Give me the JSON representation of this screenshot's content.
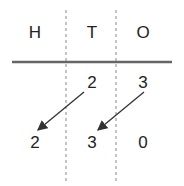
{
  "headers": [
    {
      "label": "H",
      "x": 35
    },
    {
      "label": "T",
      "x": 92
    },
    {
      "label": "O",
      "x": 143
    }
  ],
  "row1": [
    {
      "value": "2",
      "x": 92
    },
    {
      "value": "3",
      "x": 143
    }
  ],
  "row2": [
    {
      "value": "2",
      "x": 35
    },
    {
      "value": "3",
      "x": 92
    },
    {
      "value": "0",
      "x": 143
    }
  ],
  "colors": {
    "line": "#666666",
    "text": "#222222",
    "arrow": "#333333"
  }
}
